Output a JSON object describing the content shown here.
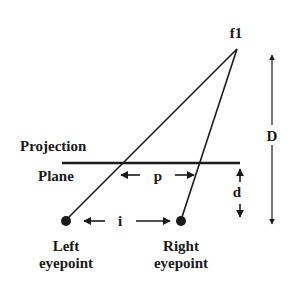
{
  "diagram": {
    "colors": {
      "ink": "#1a1a1a",
      "background": "#ffffff"
    },
    "focal_point": {
      "label": "f1"
    },
    "projection_plane": {
      "label_line1": "Projection",
      "label_line2": "Plane"
    },
    "dimensions": {
      "D": "D",
      "d": "d",
      "p": "p",
      "i": "i"
    },
    "eyepoints": {
      "left": {
        "line1": "Left",
        "line2": "eyepoint"
      },
      "right": {
        "line1": "Right",
        "line2": "eyepoint"
      }
    }
  }
}
